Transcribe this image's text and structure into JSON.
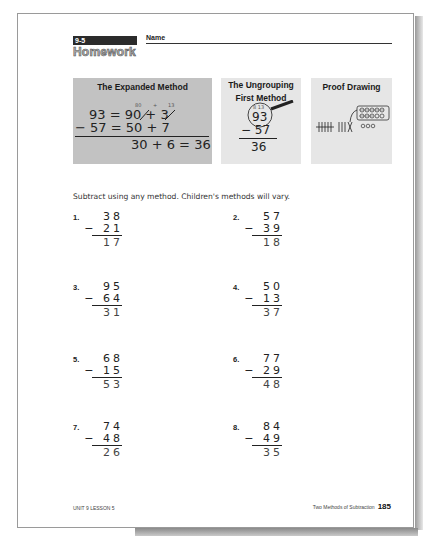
{
  "header": {
    "lesson_tag": "9-5",
    "title": "Homework",
    "name_label": "Name"
  },
  "examples": {
    "expanded": {
      "title": "The Expanded Method",
      "ungroup_marks": [
        "80",
        "+",
        "13"
      ],
      "row1": "93 = 90 + 3",
      "row2": "− 57 = 50 + 7",
      "row3": "30 +  6 = 36"
    },
    "ungrouping": {
      "title_line1": "The Ungrouping",
      "title_line2": "First Method",
      "marks": "8 13",
      "top": "93",
      "sub": "− 57",
      "answer": "36"
    },
    "proof": {
      "title": "Proof Drawing"
    }
  },
  "instructions": "Subtract using any method.  Children's methods will vary.",
  "problems": [
    {
      "num": "1.",
      "top": "38",
      "sub": "− 21",
      "answer": "17"
    },
    {
      "num": "2.",
      "top": "57",
      "sub": "− 39",
      "answer": "18"
    },
    {
      "num": "3.",
      "top": "95",
      "sub": "− 64",
      "answer": "31"
    },
    {
      "num": "4.",
      "top": "50",
      "sub": "− 13",
      "answer": "37"
    },
    {
      "num": "5.",
      "top": "68",
      "sub": "− 15",
      "answer": "53"
    },
    {
      "num": "6.",
      "top": "77",
      "sub": "− 29",
      "answer": "48"
    },
    {
      "num": "7.",
      "top": "74",
      "sub": "− 48",
      "answer": "26"
    },
    {
      "num": "8.",
      "top": "84",
      "sub": "− 49",
      "answer": "35"
    }
  ],
  "footer": {
    "left": "UNIT 9 LESSON 5",
    "right": "Two Methods of Subtraction",
    "page_number": "185"
  }
}
